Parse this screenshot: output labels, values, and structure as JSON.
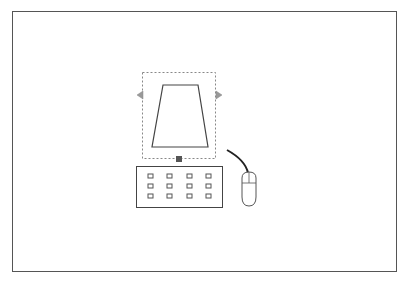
{
  "diagram": {
    "title": "",
    "elements": [
      {
        "id": "monitor",
        "label": "monitor-trapezoid-selected"
      },
      {
        "id": "keyboard",
        "label": "keyboard",
        "rows": 3,
        "cols": 4
      },
      {
        "id": "mouse",
        "label": "mouse-with-cable"
      }
    ],
    "colors": {
      "stroke": "#444444",
      "selection": "#888888",
      "handle": "#555555",
      "arrow": "#999999"
    }
  }
}
